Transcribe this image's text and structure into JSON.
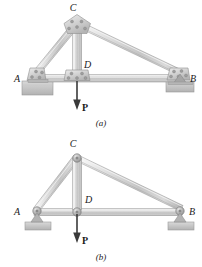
{
  "figure": {
    "panels": [
      {
        "id": "a",
        "caption": "(a)",
        "description": "riveted-gusset truss",
        "joints": [
          {
            "name": "A",
            "label": "A",
            "x": 37,
            "y": 79,
            "type": "pin-gusset-support"
          },
          {
            "name": "B",
            "label": "B",
            "x": 180,
            "y": 79,
            "type": "rocker-gusset-support"
          },
          {
            "name": "C",
            "label": "C",
            "x": 77,
            "y": 24,
            "type": "gusset-plate"
          },
          {
            "name": "D",
            "label": "D",
            "x": 77,
            "y": 79,
            "type": "gusset-plate"
          }
        ],
        "members": [
          {
            "from": "A",
            "to": "C"
          },
          {
            "from": "C",
            "to": "B"
          },
          {
            "from": "A",
            "to": "D"
          },
          {
            "from": "D",
            "to": "B"
          },
          {
            "from": "C",
            "to": "D"
          }
        ],
        "load": {
          "label": "P",
          "at": "D",
          "direction": "down",
          "tip_y": 109
        }
      },
      {
        "id": "b",
        "caption": "(b)",
        "description": "idealized pin-jointed truss",
        "joints": [
          {
            "name": "A",
            "label": "A",
            "x": 37,
            "y": 212,
            "type": "pin-support"
          },
          {
            "name": "B",
            "label": "B",
            "x": 180,
            "y": 212,
            "type": "roller-support"
          },
          {
            "name": "C",
            "label": "C",
            "x": 77,
            "y": 158,
            "type": "pin"
          },
          {
            "name": "D",
            "label": "D",
            "x": 77,
            "y": 212,
            "type": "pin"
          }
        ],
        "members": [
          {
            "from": "A",
            "to": "C"
          },
          {
            "from": "C",
            "to": "B"
          },
          {
            "from": "A",
            "to": "D"
          },
          {
            "from": "D",
            "to": "B"
          },
          {
            "from": "C",
            "to": "D"
          }
        ],
        "load": {
          "label": "P",
          "at": "D",
          "direction": "down",
          "tip_y": 242
        }
      }
    ],
    "labels": {
      "A": "A",
      "B": "B",
      "C": "C",
      "D": "D",
      "P": "P",
      "caption_a": "(a)",
      "caption_b": "(b)"
    },
    "colors": {
      "member_light": "#e9e9e9",
      "member_mid": "#c9c9c9",
      "member_dark": "#a8a8a8",
      "outline": "#8c8c8c",
      "ground": "#b8b8b8",
      "rivet": "#9a9a9a",
      "text": "#1a1a1a",
      "background": "#ffffff"
    }
  }
}
